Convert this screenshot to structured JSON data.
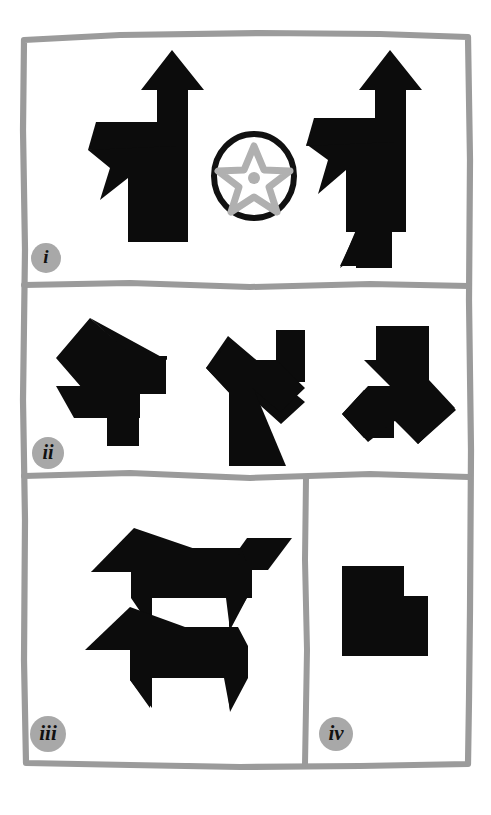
{
  "figure": {
    "background_color": "#ffffff",
    "frame_color": "#9b9b9b",
    "shape_color": "#0c0c0c",
    "accent_gray": "#b0b0b0",
    "badge_color": "#a8a8a8",
    "width": 491,
    "height": 815
  },
  "panels": [
    {
      "id": "panel-i",
      "label": "i",
      "bounds": {
        "x": 22,
        "y": 32,
        "w": 448,
        "h": 252
      },
      "items": [
        {
          "name": "tangram-figure-left",
          "type": "black-polygon-silhouette",
          "description": "standing figure with upward arrow head"
        },
        {
          "name": "star-in-circle-symbol",
          "type": "gray-star-in-black-ring",
          "description": "five pointed gray star outline with center dot inside black circle"
        },
        {
          "name": "tangram-figure-right",
          "type": "black-polygon-silhouette",
          "description": "standing figure with upward arrow head and lower triangular tail"
        }
      ]
    },
    {
      "id": "panel-ii",
      "label": "ii",
      "bounds": {
        "x": 22,
        "y": 288,
        "w": 448,
        "h": 186
      },
      "items": [
        {
          "name": "tangram-shape-ii-a",
          "type": "black-polygon-silhouette",
          "description": "arrow-like cluster pointing right"
        },
        {
          "name": "tangram-shape-ii-b",
          "type": "black-polygon-silhouette",
          "description": "angular cluster with square block upper right"
        },
        {
          "name": "tangram-shape-ii-c",
          "type": "black-polygon-silhouette",
          "description": "angular cluster with diagonal arm"
        }
      ]
    },
    {
      "id": "panel-iii",
      "label": "iii",
      "bounds": {
        "x": 22,
        "y": 478,
        "w": 283,
        "h": 287
      },
      "items": [
        {
          "name": "tangram-animal-top",
          "type": "black-polygon-silhouette",
          "description": "dog-like silhouette with raised tail"
        },
        {
          "name": "tangram-animal-bottom",
          "type": "black-polygon-silhouette",
          "description": "dog-like silhouette without raised tail"
        }
      ]
    },
    {
      "id": "panel-iv",
      "label": "iv",
      "bounds": {
        "x": 305,
        "y": 478,
        "w": 165,
        "h": 287
      },
      "items": [
        {
          "name": "tangram-block-iv",
          "type": "black-polygon-silhouette",
          "description": "solid L-notched rectangular block"
        }
      ]
    }
  ],
  "badges": [
    {
      "label": "i",
      "cx": 46,
      "cy": 258,
      "r": 15
    },
    {
      "label": "ii",
      "cx": 48,
      "cy": 453,
      "r": 16
    },
    {
      "label": "iii",
      "cx": 48,
      "cy": 734,
      "r": 18
    },
    {
      "label": "iv",
      "cx": 336,
      "cy": 734,
      "r": 17
    }
  ]
}
